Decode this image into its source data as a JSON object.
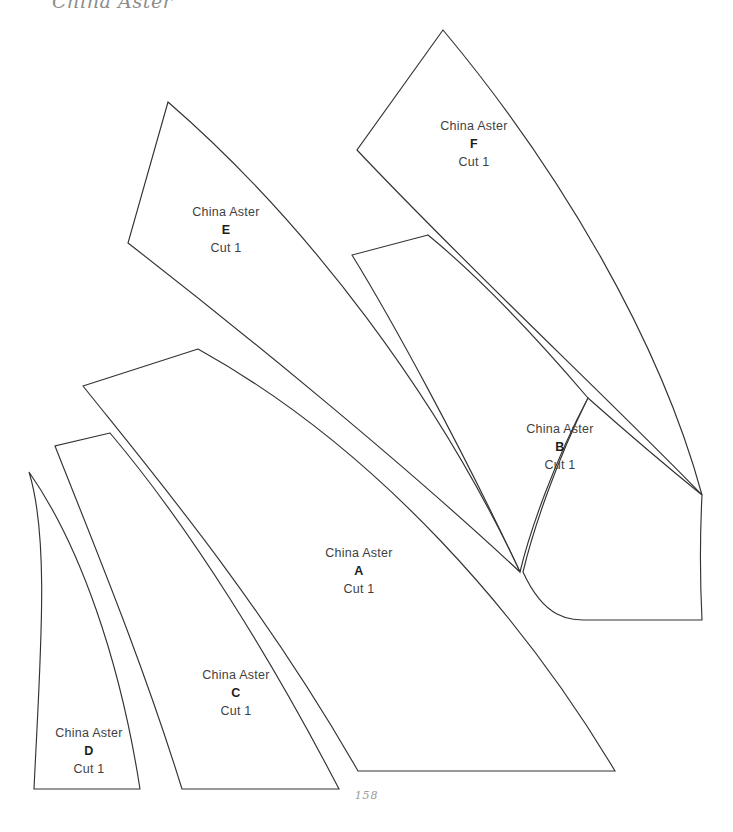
{
  "page": {
    "running_head": "China Aster",
    "folio": "158",
    "background_color": "#ffffff",
    "ink_color": "#333333",
    "text_color": "#3f3f3f",
    "width": 733,
    "height": 832
  },
  "pattern": {
    "name": "China Aster",
    "type": "quilt-template-sheet",
    "piece_count": 6
  },
  "pieces": [
    {
      "id": "a",
      "name": "China Aster",
      "letter": "A",
      "cut": "Cut 1",
      "label_x": 359,
      "label_y": 572,
      "path": "M 198 349 L 83 386 C 150 470 260 600 358 771 L 615 771 C 525 620 380 450 198 349 Z"
    },
    {
      "id": "b",
      "name": "China Aster",
      "letter": "B",
      "cut": "Cut 1",
      "label_x": 560,
      "label_y": 448,
      "path": "M 428 235 L 352 255 C 392 320 462 448 520 572 C 530 530 555 460 588 398 C 530 330 478 276 428 235 Z"
    },
    {
      "id": "c",
      "name": "China Aster",
      "letter": "C",
      "cut": "Cut 1",
      "label_x": 236,
      "label_y": 694,
      "path": "M 110 433 L 55 446 C 92 540 142 660 182 789 L 339 789 C 272 660 192 530 110 433 Z"
    },
    {
      "id": "d",
      "name": "China Aster",
      "letter": "D",
      "cut": "Cut 1",
      "label_x": 89,
      "label_y": 752,
      "path": "M 29 472 C 50 540 40 660 34 789 L 140 789 C 120 660 80 545 29 472 Z"
    },
    {
      "id": "e",
      "name": "China Aster",
      "letter": "E",
      "cut": "Cut 1",
      "label_x": 226,
      "label_y": 231,
      "path": "M 168 102 L 128 243 C 240 330 400 460 520 572 C 440 400 310 225 168 102 Z"
    },
    {
      "id": "f",
      "name": "China Aster",
      "letter": "F",
      "cut": "Cut 1",
      "label_x": 474,
      "label_y": 145,
      "path": "M 443 30 L 357 150 C 470 270 610 400 702 495 C 660 340 560 170 443 30 Z"
    },
    {
      "id": "b2",
      "name": "China Aster",
      "letter": "B-lower",
      "cut": "Cut 1",
      "label_x": -1000,
      "label_y": -1000,
      "path": "M 588 398 C 556 462 533 530 523 572 C 545 620 570 620 588 620 L 702 620 C 700 580 700 535 702 495 C 665 465 624 430 588 398 Z"
    }
  ]
}
